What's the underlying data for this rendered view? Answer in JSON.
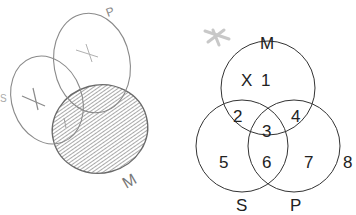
{
  "sketch": {
    "labels": {
      "left": "S",
      "top": "P",
      "bottom": "M"
    },
    "marks": [
      "X",
      "X",
      "X"
    ],
    "shaded_region": "M"
  },
  "venn": {
    "sets": {
      "top": "M",
      "left": "S",
      "right": "P"
    },
    "regions": {
      "r1": "1",
      "r2": "2",
      "r3": "3",
      "r4": "4",
      "r5": "5",
      "r6": "6",
      "r7": "7",
      "r8": "8"
    },
    "x_mark": "X"
  }
}
